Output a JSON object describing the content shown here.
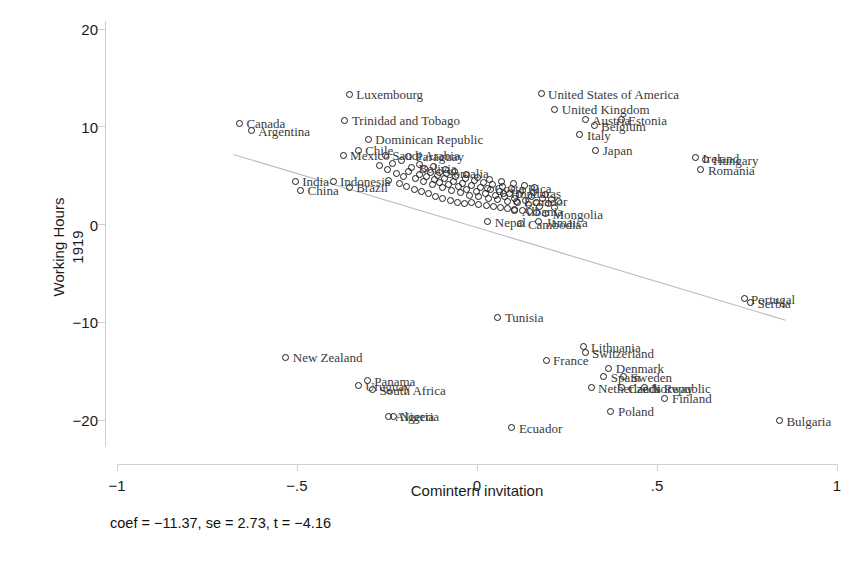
{
  "chart_data": {
    "type": "scatter",
    "title": "",
    "xlabel": "Comintern invitation",
    "ylabel": "Working Hours\n1919",
    "ylabel_line1": "Working Hours",
    "ylabel_line2": "1919",
    "xlim": [
      -1,
      1
    ],
    "ylim": [
      -22.8,
      20.8
    ],
    "xticks": [
      -1,
      -0.5,
      0,
      0.5,
      1
    ],
    "xticklabels": [
      "-1",
      "-.5",
      "0",
      ".5",
      "1"
    ],
    "yticks": [
      -20,
      -10,
      0,
      10,
      20
    ],
    "yticklabels": [
      "-20",
      "-10",
      "0",
      "10",
      "20"
    ],
    "grid": false,
    "legend": null,
    "marker_style": "open-circle",
    "marker_color": "#1b1b1b",
    "label_color": "#3a3a3a",
    "fit_line": {
      "label": "linear fit",
      "color": "#b9b9b9",
      "x_start": -0.677,
      "y_start": 7.17,
      "x_end": 0.857,
      "y_end": -9.79,
      "slope": -11.37,
      "intercept": -0.52
    },
    "annotation": "coef = −11.37, se = 2.73, t = −4.16",
    "stats": {
      "coef": -11.37,
      "se": 2.73,
      "t": -4.16
    },
    "points": [
      {
        "label": "Luxembourg",
        "x": -0.355,
        "y": 13.3,
        "lx": 7,
        "ly": 0
      },
      {
        "label": "United States of America",
        "x": 0.178,
        "y": 13.4,
        "lx": 7,
        "ly": 0
      },
      {
        "label": "United Kingdom",
        "x": 0.216,
        "y": 11.8,
        "lx": 7,
        "ly": 0
      },
      {
        "label": "Canada",
        "x": -0.66,
        "y": 10.35,
        "lx": 7,
        "ly": 0
      },
      {
        "label": "Trinidad and Tobago",
        "x": -0.367,
        "y": 10.65,
        "lx": 7,
        "ly": 0
      },
      {
        "label": "Argentina",
        "x": -0.627,
        "y": 9.6,
        "lx": 7,
        "ly": 0
      },
      {
        "label": "Austria",
        "x": 0.3,
        "y": 10.7,
        "lx": 7,
        "ly": 0
      },
      {
        "label": "Estonia",
        "x": 0.4,
        "y": 10.7,
        "lx": 7,
        "ly": 0
      },
      {
        "label": "Belgium",
        "x": 0.325,
        "y": 10.1,
        "lx": 7,
        "ly": 0
      },
      {
        "label": "Dominican Republic",
        "x": -0.302,
        "y": 8.7,
        "lx": 7,
        "ly": 0
      },
      {
        "label": "Italy",
        "x": 0.286,
        "y": 9.2,
        "lx": 7,
        "ly": 0
      },
      {
        "label": "Japan",
        "x": 0.33,
        "y": 7.6,
        "lx": 7,
        "ly": 0
      },
      {
        "label": "Chile",
        "x": -0.33,
        "y": 7.6,
        "lx": 7,
        "ly": 0
      },
      {
        "label": "Mexico",
        "x": -0.372,
        "y": 7.1,
        "lx": 7,
        "ly": 0
      },
      {
        "label": "Saudi Arabia",
        "x": -0.255,
        "y": 7.1,
        "lx": 7,
        "ly": 0
      },
      {
        "label": "Paraguay",
        "x": -0.19,
        "y": 7.0,
        "lx": 7,
        "ly": 0
      },
      {
        "label": "Ireland",
        "x": 0.607,
        "y": 6.85,
        "lx": 7,
        "ly": 0
      },
      {
        "label": "Hungary",
        "x": 0.636,
        "y": 6.6,
        "lx": 7,
        "ly": 0
      },
      {
        "label": "Romania",
        "x": 0.622,
        "y": 5.6,
        "lx": 7,
        "ly": 0
      },
      {
        "label": "Bolivia",
        "x": -0.182,
        "y": 5.8,
        "lx": 7,
        "ly": 0
      },
      {
        "label": "Somalia",
        "x": -0.105,
        "y": 5.3,
        "lx": 7,
        "ly": 0
      },
      {
        "label": "India",
        "x": -0.505,
        "y": 4.4,
        "lx": 7,
        "ly": 0
      },
      {
        "label": "China",
        "x": -0.49,
        "y": 3.5,
        "lx": 7,
        "ly": 0
      },
      {
        "label": "Indonesia",
        "x": -0.4,
        "y": 4.4,
        "lx": 7,
        "ly": 0
      },
      {
        "label": "Brazil",
        "x": -0.355,
        "y": 3.8,
        "lx": 7,
        "ly": 0
      },
      {
        "label": "Costa Rica",
        "x": 0.03,
        "y": 3.7,
        "lx": 7,
        "ly": 0
      },
      {
        "label": "Honduras",
        "x": 0.074,
        "y": 3.2,
        "lx": 7,
        "ly": 0
      },
      {
        "label": "Ecuador",
        "x": 0.111,
        "y": 2.4,
        "lx": 7,
        "ly": 0
      },
      {
        "label": "Nepal",
        "x": 0.03,
        "y": 0.3,
        "lx": 7,
        "ly": 0
      },
      {
        "label": "Albania",
        "x": 0.105,
        "y": 1.4,
        "lx": 7,
        "ly": 0
      },
      {
        "label": "Mongolia",
        "x": 0.19,
        "y": 1.1,
        "lx": 7,
        "ly": 0
      },
      {
        "label": "Cambodia",
        "x": 0.122,
        "y": 0.1,
        "lx": 7,
        "ly": 0
      },
      {
        "label": "Jamaica",
        "x": 0.172,
        "y": 0.3,
        "lx": 7,
        "ly": 0
      },
      {
        "label": "Portugal",
        "x": 0.742,
        "y": -7.6,
        "lx": 7,
        "ly": 0
      },
      {
        "label": "Serbia",
        "x": 0.76,
        "y": -8.0,
        "lx": 7,
        "ly": 0
      },
      {
        "label": "Tunisia",
        "x": 0.058,
        "y": -9.5,
        "lx": 7,
        "ly": 0
      },
      {
        "label": "Lithuania",
        "x": 0.297,
        "y": -12.5,
        "lx": 7,
        "ly": 0
      },
      {
        "label": "Switzerland",
        "x": 0.3,
        "y": -13.1,
        "lx": 7,
        "ly": 0
      },
      {
        "label": "New Zealand",
        "x": -0.531,
        "y": -13.6,
        "lx": 7,
        "ly": 0
      },
      {
        "label": "France",
        "x": 0.192,
        "y": -13.9,
        "lx": 7,
        "ly": 0
      },
      {
        "label": "Denmark",
        "x": 0.366,
        "y": -14.7,
        "lx": 7,
        "ly": 0
      },
      {
        "label": "Sweden",
        "x": 0.408,
        "y": -15.6,
        "lx": 7,
        "ly": 0
      },
      {
        "label": "Spain",
        "x": 0.352,
        "y": -15.6,
        "lx": 7,
        "ly": 0
      },
      {
        "label": "Panama",
        "x": -0.305,
        "y": -16.0,
        "lx": 7,
        "ly": 0
      },
      {
        "label": "Uruguay",
        "x": -0.33,
        "y": -16.5,
        "lx": 7,
        "ly": 0
      },
      {
        "label": "South Africa",
        "x": -0.29,
        "y": -16.9,
        "lx": 7,
        "ly": 0
      },
      {
        "label": "Netherlands",
        "x": 0.317,
        "y": -16.7,
        "lx": 7,
        "ly": 0
      },
      {
        "label": "Czech Republic",
        "x": 0.4,
        "y": -16.7,
        "lx": 7,
        "ly": 0
      },
      {
        "label": "Norway",
        "x": 0.464,
        "y": -16.7,
        "lx": 7,
        "ly": 0
      },
      {
        "label": "Finland",
        "x": 0.522,
        "y": -17.8,
        "lx": 7,
        "ly": 0
      },
      {
        "label": "Nigeria",
        "x": -0.233,
        "y": -19.6,
        "lx": 7,
        "ly": 0
      },
      {
        "label": "Algeria",
        "x": -0.247,
        "y": -19.6,
        "lx": 7,
        "ly": 0
      },
      {
        "label": "Poland",
        "x": 0.372,
        "y": -19.1,
        "lx": 7,
        "ly": 0
      },
      {
        "label": "Bulgaria",
        "x": 0.84,
        "y": -20.1,
        "lx": 7,
        "ly": 0
      },
      {
        "label": "Ecuador",
        "x": 0.097,
        "y": -20.8,
        "lx": 7,
        "ly": 0
      }
    ],
    "cluster_points": [
      {
        "x": -0.25,
        "y": 5.6
      },
      {
        "x": -0.225,
        "y": 5.2
      },
      {
        "x": -0.205,
        "y": 4.9
      },
      {
        "x": -0.19,
        "y": 5.4
      },
      {
        "x": -0.17,
        "y": 4.7
      },
      {
        "x": -0.16,
        "y": 5.1
      },
      {
        "x": -0.15,
        "y": 4.4
      },
      {
        "x": -0.14,
        "y": 4.9
      },
      {
        "x": -0.13,
        "y": 5.3
      },
      {
        "x": -0.125,
        "y": 4.1
      },
      {
        "x": -0.118,
        "y": 4.6
      },
      {
        "x": -0.11,
        "y": 5.0
      },
      {
        "x": -0.103,
        "y": 4.3
      },
      {
        "x": -0.097,
        "y": 3.8
      },
      {
        "x": -0.09,
        "y": 4.7
      },
      {
        "x": -0.085,
        "y": 5.2
      },
      {
        "x": -0.078,
        "y": 4.1
      },
      {
        "x": -0.072,
        "y": 3.5
      },
      {
        "x": -0.065,
        "y": 4.4
      },
      {
        "x": -0.06,
        "y": 4.9
      },
      {
        "x": -0.052,
        "y": 3.9
      },
      {
        "x": -0.046,
        "y": 3.3
      },
      {
        "x": -0.04,
        "y": 4.2
      },
      {
        "x": -0.033,
        "y": 4.7
      },
      {
        "x": -0.028,
        "y": 3.6
      },
      {
        "x": -0.021,
        "y": 3.0
      },
      {
        "x": -0.015,
        "y": 4.0
      },
      {
        "x": -0.008,
        "y": 4.5
      },
      {
        "x": -0.002,
        "y": 3.4
      },
      {
        "x": 0.005,
        "y": 2.9
      },
      {
        "x": 0.011,
        "y": 3.8
      },
      {
        "x": 0.018,
        "y": 4.3
      },
      {
        "x": 0.024,
        "y": 3.2
      },
      {
        "x": 0.031,
        "y": 2.7
      },
      {
        "x": 0.038,
        "y": 3.6
      },
      {
        "x": 0.044,
        "y": 4.1
      },
      {
        "x": 0.05,
        "y": 3.0
      },
      {
        "x": 0.057,
        "y": 2.6
      },
      {
        "x": 0.063,
        "y": 3.4
      },
      {
        "x": 0.07,
        "y": 3.9
      },
      {
        "x": 0.077,
        "y": 2.9
      },
      {
        "x": 0.084,
        "y": 2.4
      },
      {
        "x": 0.09,
        "y": 3.2
      },
      {
        "x": 0.097,
        "y": 3.7
      },
      {
        "x": 0.104,
        "y": 2.7
      },
      {
        "x": 0.112,
        "y": 2.2
      },
      {
        "x": 0.119,
        "y": 3.1
      },
      {
        "x": 0.127,
        "y": 3.5
      },
      {
        "x": 0.134,
        "y": 2.5
      },
      {
        "x": 0.142,
        "y": 2.0
      },
      {
        "x": 0.15,
        "y": 2.9
      },
      {
        "x": 0.158,
        "y": 3.3
      },
      {
        "x": 0.166,
        "y": 2.3
      },
      {
        "x": 0.174,
        "y": 1.8
      },
      {
        "x": 0.182,
        "y": 2.7
      },
      {
        "x": 0.19,
        "y": 3.1
      },
      {
        "x": 0.199,
        "y": 2.1
      },
      {
        "x": 0.208,
        "y": 2.6
      },
      {
        "x": 0.216,
        "y": 1.7
      },
      {
        "x": 0.225,
        "y": 2.4
      },
      {
        "x": -0.245,
        "y": 4.5
      },
      {
        "x": -0.215,
        "y": 4.2
      },
      {
        "x": -0.195,
        "y": 3.9
      },
      {
        "x": -0.175,
        "y": 3.6
      },
      {
        "x": -0.155,
        "y": 3.4
      },
      {
        "x": -0.135,
        "y": 3.2
      },
      {
        "x": -0.115,
        "y": 2.9
      },
      {
        "x": -0.095,
        "y": 2.7
      },
      {
        "x": -0.075,
        "y": 2.5
      },
      {
        "x": -0.055,
        "y": 2.3
      },
      {
        "x": -0.035,
        "y": 2.1
      },
      {
        "x": -0.015,
        "y": 2.2
      },
      {
        "x": 0.005,
        "y": 2.0
      },
      {
        "x": 0.025,
        "y": 1.9
      },
      {
        "x": 0.045,
        "y": 1.8
      },
      {
        "x": 0.065,
        "y": 1.7
      },
      {
        "x": 0.085,
        "y": 1.6
      },
      {
        "x": 0.105,
        "y": 1.5
      },
      {
        "x": 0.125,
        "y": 1.4
      },
      {
        "x": 0.145,
        "y": 1.3
      },
      {
        "x": 0.165,
        "y": 1.2
      },
      {
        "x": -0.27,
        "y": 6.0
      },
      {
        "x": -0.235,
        "y": 6.2
      },
      {
        "x": -0.21,
        "y": 6.5
      },
      {
        "x": -0.16,
        "y": 6.1
      },
      {
        "x": -0.145,
        "y": 5.7
      },
      {
        "x": -0.12,
        "y": 5.9
      },
      {
        "x": -0.088,
        "y": 5.6
      },
      {
        "x": -0.062,
        "y": 5.4
      },
      {
        "x": -0.03,
        "y": 5.1
      },
      {
        "x": 0.002,
        "y": 4.8
      },
      {
        "x": 0.035,
        "y": 4.6
      },
      {
        "x": 0.068,
        "y": 4.4
      },
      {
        "x": 0.1,
        "y": 4.2
      },
      {
        "x": 0.133,
        "y": 4.0
      },
      {
        "x": 0.16,
        "y": 3.8
      }
    ]
  }
}
